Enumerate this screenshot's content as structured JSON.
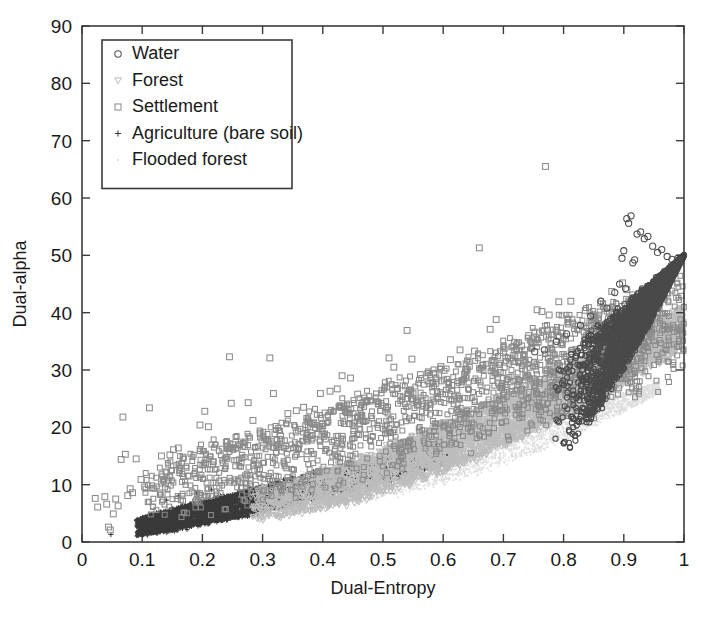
{
  "chart_data": {
    "type": "scatter",
    "title": "",
    "xlabel": "Dual-Entropy",
    "ylabel": "Dual-alpha",
    "xlim": [
      0,
      1
    ],
    "ylim": [
      0,
      90
    ],
    "xticks": [
      "0",
      "0.1",
      "0.2",
      "0.3",
      "0.4",
      "0.5",
      "0.6",
      "0.7",
      "0.8",
      "0.9",
      "1"
    ],
    "xtick_values": [
      0,
      0.1,
      0.2,
      0.3,
      0.4,
      0.5,
      0.6,
      0.7,
      0.8,
      0.9,
      1
    ],
    "yticks": [
      "0",
      "10",
      "20",
      "30",
      "40",
      "50",
      "60",
      "70",
      "80",
      "90"
    ],
    "ytick_values": [
      0,
      10,
      20,
      30,
      40,
      50,
      60,
      70,
      80,
      90
    ],
    "grid": false,
    "box": true,
    "tick_direction": "in",
    "legend_position": "upper-left",
    "legend": [
      {
        "label": "Water",
        "marker": "circle",
        "color": "#4f4f4f"
      },
      {
        "label": "Forest",
        "marker": "triangle-down",
        "color": "#b9b9b9"
      },
      {
        "label": "Settlement",
        "marker": "square",
        "color": "#8d8d8d"
      },
      {
        "label": "Agriculture (bare soil)",
        "marker": "plus",
        "color": "#3a3a3a"
      },
      {
        "label": "Flooded forest",
        "marker": "dot",
        "color": "#d7d7d7"
      }
    ],
    "series": [
      {
        "name": "Water",
        "marker": "circle",
        "color": "#4a4a4a",
        "description": "Dense wedge at high entropy (0.82-1.0) rising from alpha 28 to 50, with a sparse arc of outliers reaching alpha 57 near entropy 0.90-0.92.",
        "cloud": {
          "x_range": [
            0.78,
            1.0
          ],
          "alpha_lower": "14 + 36*((x-0.78)/0.22)^1.3",
          "alpha_upper": "30 + 20*((x-0.78)/0.22)",
          "count": 2600
        },
        "outliers": [
          [
            0.885,
            43.5
          ],
          [
            0.893,
            45.0
          ],
          [
            0.897,
            49.5
          ],
          [
            0.9,
            50.8
          ],
          [
            0.903,
            44.2
          ],
          [
            0.905,
            56.4
          ],
          [
            0.908,
            55.6
          ],
          [
            0.912,
            56.9
          ],
          [
            0.915,
            48.7
          ],
          [
            0.918,
            49.2
          ],
          [
            0.922,
            53.7
          ],
          [
            0.928,
            54.1
          ],
          [
            0.934,
            52.9
          ],
          [
            0.94,
            53.3
          ],
          [
            0.948,
            51.6
          ],
          [
            0.956,
            50.5
          ],
          [
            0.963,
            51.0
          ],
          [
            0.972,
            49.8
          ],
          [
            0.98,
            49.3
          ],
          [
            0.99,
            49.5
          ],
          [
            0.862,
            42.0
          ],
          [
            0.872,
            40.8
          ],
          [
            0.845,
            39.4
          ],
          [
            0.828,
            37.8
          ],
          [
            0.805,
            36.3
          ],
          [
            0.788,
            35.0
          ],
          [
            0.768,
            33.5
          ],
          [
            0.752,
            33.2
          ]
        ]
      },
      {
        "name": "Forest",
        "marker": "triangle-down",
        "color": "#bdbdbd",
        "description": "Light grey band through the middle of the arc, entropy 0.30-1.0, alpha rising from 6 to 45.",
        "cloud": {
          "x_range": [
            0.28,
            1.0
          ],
          "alpha_lower": "4 + 30*((x-0.28)/0.72)^1.6",
          "alpha_upper": "9 + 32*((x-0.28)/0.72)^1.25",
          "count": 4200
        }
      },
      {
        "name": "Settlement",
        "marker": "square",
        "color": "#8a8a8a",
        "description": "Widely scattered squares forming the upper envelope of the whole cloud, from entropy 0.02 up to 1.0; many isolated points well above the main band.",
        "cloud": {
          "x_range": [
            0.1,
            1.0
          ],
          "alpha_lower": "4 + 24*((x-0.10)/0.90)^1.4",
          "alpha_upper": "13 + 33*((x-0.10)/0.90)^1.05",
          "count": 1700
        },
        "outliers": [
          [
            0.022,
            7.6
          ],
          [
            0.026,
            6.1
          ],
          [
            0.038,
            7.9
          ],
          [
            0.041,
            6.6
          ],
          [
            0.044,
            2.6
          ],
          [
            0.047,
            2.1
          ],
          [
            0.052,
            4.9
          ],
          [
            0.056,
            7.5
          ],
          [
            0.06,
            6.3
          ],
          [
            0.065,
            14.4
          ],
          [
            0.068,
            21.8
          ],
          [
            0.072,
            15.3
          ],
          [
            0.076,
            8.1
          ],
          [
            0.08,
            9.3
          ],
          [
            0.084,
            8.6
          ],
          [
            0.09,
            14.5
          ],
          [
            0.098,
            10.9
          ],
          [
            0.104,
            9.6
          ],
          [
            0.112,
            23.4
          ],
          [
            0.118,
            9.4
          ],
          [
            0.132,
            15.0
          ],
          [
            0.146,
            15.2
          ],
          [
            0.152,
            16.1
          ],
          [
            0.16,
            16.4
          ],
          [
            0.168,
            14.8
          ],
          [
            0.178,
            11.5
          ],
          [
            0.196,
            20.4
          ],
          [
            0.204,
            22.8
          ],
          [
            0.21,
            20.1
          ],
          [
            0.218,
            14.0
          ],
          [
            0.245,
            32.3
          ],
          [
            0.248,
            24.2
          ],
          [
            0.262,
            17.0
          ],
          [
            0.276,
            24.3
          ],
          [
            0.284,
            21.2
          ],
          [
            0.296,
            19.0
          ],
          [
            0.312,
            32.1
          ],
          [
            0.318,
            25.9
          ],
          [
            0.33,
            18.5
          ],
          [
            0.342,
            22.4
          ],
          [
            0.356,
            22.9
          ],
          [
            0.368,
            23.5
          ],
          [
            0.382,
            20.7
          ],
          [
            0.396,
            25.9
          ],
          [
            0.412,
            26.3
          ],
          [
            0.424,
            26.7
          ],
          [
            0.432,
            29.0
          ],
          [
            0.446,
            28.6
          ],
          [
            0.458,
            25.8
          ],
          [
            0.47,
            24.4
          ],
          [
            0.492,
            24.1
          ],
          [
            0.51,
            32.1
          ],
          [
            0.518,
            30.5
          ],
          [
            0.524,
            26.8
          ],
          [
            0.54,
            36.9
          ],
          [
            0.548,
            31.9
          ],
          [
            0.562,
            29.2
          ],
          [
            0.578,
            27.6
          ],
          [
            0.596,
            30.6
          ],
          [
            0.612,
            31.8
          ],
          [
            0.628,
            33.5
          ],
          [
            0.64,
            30.1
          ],
          [
            0.652,
            33.3
          ],
          [
            0.66,
            51.3
          ],
          [
            0.666,
            30.8
          ],
          [
            0.678,
            37.1
          ],
          [
            0.688,
            38.8
          ],
          [
            0.7,
            33.0
          ],
          [
            0.716,
            31.5
          ],
          [
            0.73,
            34.2
          ],
          [
            0.742,
            36.0
          ],
          [
            0.756,
            40.5
          ],
          [
            0.764,
            40.2
          ],
          [
            0.77,
            65.5
          ],
          [
            0.776,
            39.6
          ],
          [
            0.792,
            41.9
          ],
          [
            0.812,
            42.0
          ],
          [
            0.836,
            40.4
          ],
          [
            0.858,
            38.6
          ],
          [
            0.88,
            43.7
          ],
          [
            0.898,
            45.2
          ],
          [
            0.905,
            44.0
          ]
        ]
      },
      {
        "name": "Agriculture (bare soil)",
        "marker": "plus",
        "color": "#3a3a3a",
        "description": "Very dense dark band hugging the lower-left boundary of the arc, entropy 0.09-0.60, alpha 1-16.",
        "cloud": {
          "x_range": [
            0.09,
            0.62
          ],
          "alpha_lower": "1 + 13*((x-0.09)/0.53)^1.2",
          "alpha_upper": "4 + 14*((x-0.09)/0.53)^0.95",
          "count": 6000
        },
        "outliers": [
          [
            0.048,
            1.3
          ],
          [
            0.098,
            3.2
          ],
          [
            0.113,
            4.8
          ],
          [
            0.14,
            7.3
          ],
          [
            0.16,
            8.0
          ],
          [
            0.19,
            8.6
          ],
          [
            0.215,
            9.1
          ]
        ]
      },
      {
        "name": "Flooded forest",
        "marker": "dot",
        "color": "#dedede",
        "description": "Very light, almost white points filling the lower interior of the arc between entropy 0.38 and 0.95, alpha 9-24.",
        "cloud": {
          "x_range": [
            0.36,
            0.96
          ],
          "alpha_lower": "6 + 20*((x-0.36)/0.60)^1.7",
          "alpha_upper": "12 + 16*((x-0.36)/0.60)^1.2",
          "count": 3200
        }
      }
    ]
  },
  "axes": {
    "x_title": "Dual-Entropy",
    "y_title": "Dual-alpha"
  }
}
